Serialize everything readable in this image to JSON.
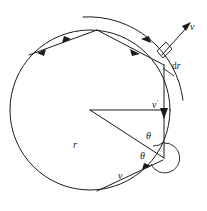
{
  "figure": {
    "name": "circle-scattering-diagram",
    "stroke_color": "#1a1a1a",
    "background_color": "#ffffff"
  },
  "labels": {
    "velocity_outer": "v",
    "velocity_inner": "v",
    "velocity_prime": "v",
    "velocity_prime_mark": "′",
    "radius": "r",
    "angle_upper": "θ",
    "angle_lower": "θ",
    "thickness_d": "d",
    "thickness_r": "r"
  },
  "geometry": {
    "circle": {
      "cx": 90,
      "cy": 110,
      "r": 80
    },
    "outer_arc_radius": 95,
    "center_point": {
      "x": 90,
      "y": 110
    },
    "vertex_top": {
      "x": 97,
      "y": 30
    },
    "vertex_right": {
      "x": 164,
      "y": 65
    },
    "vertex_bottom_right": {
      "x": 165,
      "y": 158
    },
    "vertex_bottom": {
      "x": 97,
      "y": 191
    },
    "vertex_left": {
      "x": 18,
      "y": 80
    }
  }
}
